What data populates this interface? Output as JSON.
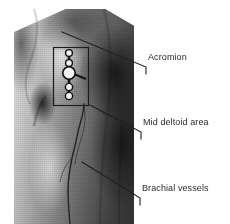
{
  "figure": {
    "type": "anatomical-photograph",
    "background_color": "#ffffff",
    "ink_color": "#2b2b2b",
    "photo": {
      "name": "shoulder-arm-photograph",
      "rendering": "black-and-white halftone print",
      "x": 14,
      "y": 9,
      "width": 120,
      "height": 215
    }
  },
  "annotations": {
    "highlight_box": {
      "name": "acromion-region-box",
      "x": 53,
      "y": 47,
      "width": 35,
      "height": 58,
      "stroke_color": "#1d1d1d"
    },
    "marker": {
      "name": "acromion-landmark-marker",
      "description": "chain of small beads with a central larger bead marking the acromion",
      "bead_count": 5
    },
    "vessel_trace": {
      "name": "brachial-vessel-trace",
      "description": "inked line following the course of the brachial vessels down the medial arm"
    }
  },
  "labels": [
    {
      "id": "acromion",
      "text": "Acromion",
      "x": 148,
      "y": 52,
      "leader": {
        "x1": 62,
        "y1": 32,
        "x2": 146,
        "y2": 67,
        "tick_to_y": 74
      }
    },
    {
      "id": "mid-deltoid-area",
      "text": "Mid deltoid area",
      "x": 143,
      "y": 117,
      "leader": {
        "x1": 90,
        "y1": 105,
        "x2": 141,
        "y2": 132,
        "tick_to_y": 139
      }
    },
    {
      "id": "brachial-vessels",
      "text": "Brachial vessels",
      "x": 142,
      "y": 183,
      "leader": {
        "x1": 82,
        "y1": 162,
        "x2": 140,
        "y2": 198,
        "tick_to_y": 205
      }
    }
  ]
}
